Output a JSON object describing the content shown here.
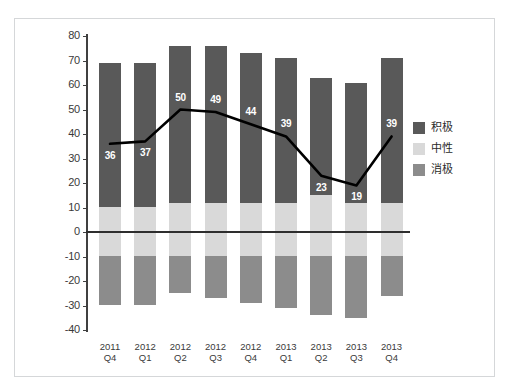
{
  "top_fragment": "▬▬▬▬▬",
  "legend": {
    "position": "right",
    "items": [
      {
        "label": "积极",
        "color": "#595959"
      },
      {
        "label": "中性",
        "color": "#d9d9d9"
      },
      {
        "label": "消极",
        "color": "#8c8c8c"
      }
    ]
  },
  "chart_data": {
    "type": "bar",
    "title": "",
    "subtitle": "",
    "xlabel": "",
    "ylabel": "",
    "grid": false,
    "stacked": true,
    "categories": [
      "2011 Q4",
      "2012 Q1",
      "2012 Q2",
      "2012 Q3",
      "2012 Q4",
      "2013 Q1",
      "2013 Q2",
      "2013 Q3",
      "2013 Q4"
    ],
    "category_lines": [
      [
        "2011",
        "Q4"
      ],
      [
        "2012",
        "Q1"
      ],
      [
        "2012",
        "Q2"
      ],
      [
        "2012",
        "Q3"
      ],
      [
        "2012",
        "Q4"
      ],
      [
        "2013",
        "Q1"
      ],
      [
        "2013",
        "Q2"
      ],
      [
        "2013",
        "Q3"
      ],
      [
        "2013",
        "Q4"
      ]
    ],
    "ylim": [
      -40,
      80
    ],
    "yticks": [
      80,
      70,
      60,
      50,
      40,
      30,
      20,
      10,
      0,
      -10,
      -20,
      -30,
      -40
    ],
    "ytick_labels": [
      "80",
      "70",
      "60",
      "50",
      "40",
      "30",
      "20",
      "10",
      "0",
      "-10",
      "-20",
      "-30",
      "-40"
    ],
    "series": [
      {
        "name": "积极",
        "color": "#595959",
        "values": [
          59,
          59,
          64,
          64,
          61,
          59,
          48,
          49,
          59
        ]
      },
      {
        "name": "中性",
        "color": "#d9d9d9",
        "values": [
          20,
          20,
          20,
          20,
          20,
          20,
          22,
          20,
          20
        ]
      },
      {
        "name": "消极",
        "color": "#8c8c8c",
        "values": [
          -20,
          -20,
          -17,
          -19,
          -21,
          -23,
          -27,
          -27,
          -18
        ]
      }
    ],
    "stack_tops": [
      69,
      69,
      76,
      76,
      73,
      71,
      63,
      61,
      71
    ],
    "neutral_tops": [
      10,
      10,
      12,
      12,
      12,
      12,
      15,
      12,
      12
    ],
    "stack_bottoms": [
      -30,
      -30,
      -25,
      -27,
      -29,
      -31,
      -34,
      -35,
      -26
    ],
    "line_series": {
      "name": "净值",
      "color": "#000000",
      "values": [
        36,
        37,
        50,
        49,
        44,
        39,
        23,
        19,
        39
      ],
      "label_position": [
        "below",
        "below",
        "above",
        "above",
        "above",
        "above",
        "below",
        "below",
        "above"
      ]
    }
  },
  "colors": {
    "positive": "#595959",
    "neutral": "#d9d9d9",
    "negative": "#8c8c8c",
    "line": "#000000",
    "axis": "#404040",
    "border": "#d5d7d9",
    "background": "#ffffff",
    "text": "#3a3a3a"
  }
}
